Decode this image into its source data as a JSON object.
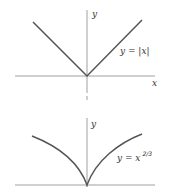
{
  "figure": {
    "top_plot": {
      "y_axis_label": "y",
      "x_axis_label": "x",
      "curve_label": "y = |x|",
      "function": "abs",
      "color": "#555555"
    },
    "bottom_plot": {
      "y_axis_label": "y",
      "curve_label_base": "y = x",
      "curve_label_exponent": "2/3",
      "function": "x^(2/3)",
      "color": "#555555"
    }
  }
}
